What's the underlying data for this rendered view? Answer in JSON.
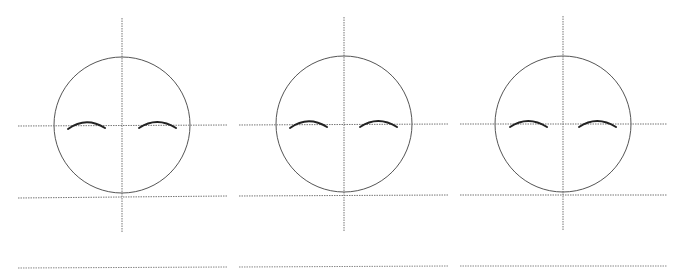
{
  "diagram": {
    "stroke_color": "#555555",
    "guide_color": "#777777",
    "brow_color": "#222222",
    "panels": [
      {
        "id": 1,
        "cx": 122,
        "cy": 125,
        "r": 68,
        "x1": 18,
        "x2": 227
      },
      {
        "id": 2,
        "cx": 344,
        "cy": 124,
        "r": 68,
        "x1": 240,
        "x2": 448
      },
      {
        "id": 3,
        "cx": 563,
        "cy": 124,
        "r": 68,
        "x1": 460,
        "x2": 667
      }
    ]
  }
}
